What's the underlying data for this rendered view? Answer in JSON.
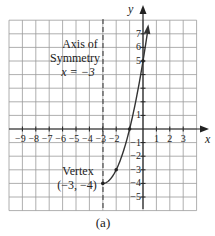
{
  "figure": {
    "caption": "(a)",
    "axis_x_label": "x",
    "axis_y_label": "y",
    "x_ticks": [
      "−9",
      "−8",
      "−7",
      "−6",
      "−5",
      "−4",
      "−3",
      "−2",
      "1",
      "2",
      "3"
    ],
    "y_ticks": [
      "7",
      "6",
      "5",
      "1",
      "−1",
      "−2",
      "−3",
      "−4",
      "−5"
    ],
    "symmetry_annotation": {
      "line1": "Axis of",
      "line2": "Symmetry",
      "line3": "x = −3"
    },
    "vertex_annotation": {
      "line1": "Vertex",
      "line2": "(−3, −4)"
    }
  },
  "chart_data": {
    "type": "line",
    "title": "",
    "xlabel": "x",
    "ylabel": "y",
    "xlim": [
      -10,
      4
    ],
    "ylim": [
      -6,
      8
    ],
    "grid": true,
    "function": "y = (x + 3)^2 - 4, x >= -3",
    "series": [
      {
        "name": "parabola branch",
        "x": [
          -3,
          -2,
          -1,
          0,
          0.35
        ],
        "y": [
          -4,
          -3,
          0,
          5,
          7.2
        ]
      }
    ],
    "points": [
      {
        "label": "vertex",
        "x": -3,
        "y": -4
      },
      {
        "x": -2,
        "y": -3
      },
      {
        "x": -1,
        "y": 0
      },
      {
        "x": 0,
        "y": 5
      }
    ],
    "axis_of_symmetry": {
      "x": -3,
      "style": "dashed"
    }
  }
}
